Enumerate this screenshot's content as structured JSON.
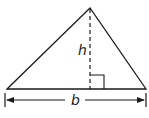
{
  "diagram": {
    "type": "triangle-area",
    "labels": {
      "height": "h",
      "base": "b"
    },
    "colors": {
      "stroke": "#1a1a1a",
      "background": "#ffffff"
    }
  }
}
